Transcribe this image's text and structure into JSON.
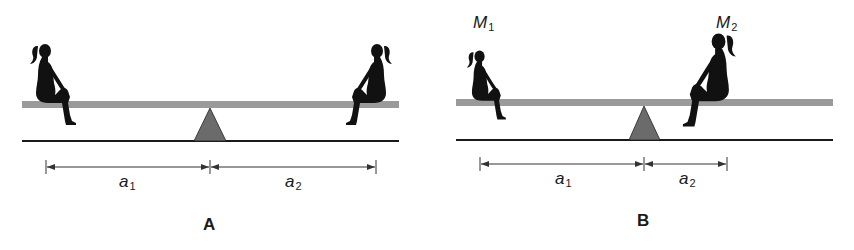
{
  "figure": {
    "panels": [
      {
        "id": "A",
        "label": "A",
        "masses": [],
        "distances": [
          {
            "symbol": "a",
            "subscript": "1"
          },
          {
            "symbol": "a",
            "subscript": "2"
          }
        ],
        "note": "Two equal girls at equal distances from fulcrum"
      },
      {
        "id": "B",
        "label": "B",
        "masses": [
          {
            "symbol": "M",
            "subscript": "1"
          },
          {
            "symbol": "M",
            "subscript": "2"
          }
        ],
        "distances": [
          {
            "symbol": "a",
            "subscript": "1"
          },
          {
            "symbol": "a",
            "subscript": "2"
          }
        ],
        "note": "Smaller girl M1 farther from fulcrum, larger girl M2 closer"
      }
    ],
    "colors": {
      "plank": "#9a9a9a",
      "fulcrum": "#6b6b6b",
      "ground": "#1a1a1a",
      "silhouette": "#111111",
      "dimension": "#333333"
    }
  }
}
